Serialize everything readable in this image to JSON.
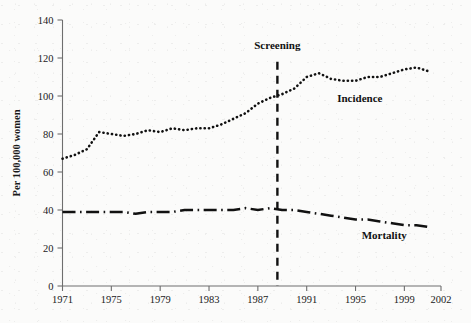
{
  "chart_data": {
    "type": "line",
    "title": "",
    "xlabel": "",
    "ylabel": "Per 100,000 women",
    "xlim": [
      1971,
      2002
    ],
    "ylim": [
      0,
      140
    ],
    "grid": false,
    "legend_position": "inline-labels",
    "xticks": [
      "1971",
      "1975",
      "1979",
      "1983",
      "1987",
      "1991",
      "1995",
      "1999",
      "2002"
    ],
    "xtick_values": [
      1971,
      1975,
      1979,
      1983,
      1987,
      1991,
      1995,
      1999,
      2002
    ],
    "yticks": [
      "0",
      "20",
      "40",
      "60",
      "80",
      "100",
      "120",
      "140"
    ],
    "ytick_values": [
      0,
      20,
      40,
      60,
      80,
      100,
      120,
      140
    ],
    "x": [
      1971,
      1972,
      1973,
      1974,
      1975,
      1976,
      1977,
      1978,
      1979,
      1980,
      1981,
      1982,
      1983,
      1984,
      1985,
      1986,
      1987,
      1988,
      1989,
      1990,
      1991,
      1992,
      1993,
      1994,
      1995,
      1996,
      1997,
      1998,
      1999,
      2000,
      2001
    ],
    "series": [
      {
        "name": "Incidence",
        "style": "dotted",
        "label_position": {
          "x": 1993.5,
          "y": 97
        },
        "values": [
          67,
          69,
          72,
          81,
          80,
          79,
          80,
          82,
          81,
          83,
          82,
          83,
          83,
          85,
          88,
          91,
          96,
          99,
          101,
          104,
          110,
          112,
          109,
          108,
          108,
          110,
          110,
          112,
          114,
          115,
          113
        ]
      },
      {
        "name": "Mortality",
        "style": "dash-dot",
        "label_position": {
          "x": 1995.5,
          "y": 25
        },
        "values": [
          39,
          39,
          39,
          39,
          39,
          39,
          38,
          39,
          39,
          39,
          40,
          40,
          40,
          40,
          40,
          41,
          40,
          41,
          40,
          40,
          39,
          38,
          37,
          36,
          35,
          35,
          34,
          33,
          32,
          32,
          31
        ]
      }
    ],
    "annotations": [
      {
        "name": "screening",
        "label": "Screening",
        "x": 1988.6,
        "label_y": 125,
        "line_top": 118,
        "line_bottom": 0
      }
    ]
  }
}
